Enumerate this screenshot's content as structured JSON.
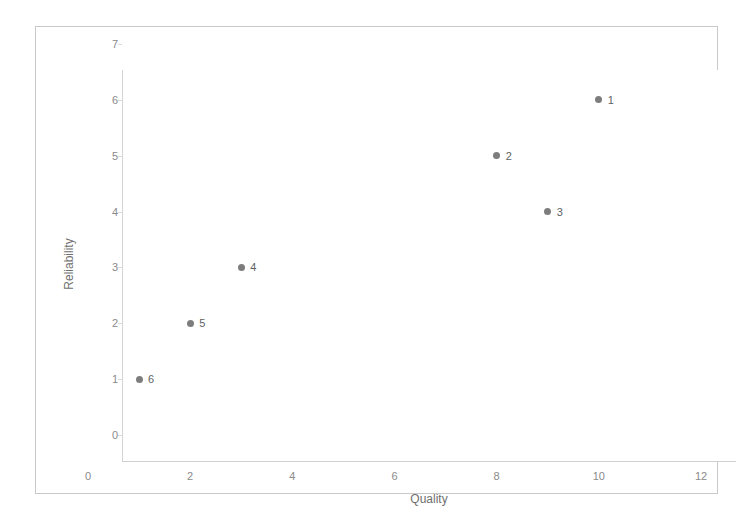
{
  "chart_data": {
    "type": "scatter",
    "title": "",
    "xlabel": "Quality",
    "ylabel": "Reliability",
    "xlim": [
      0,
      12
    ],
    "ylim": [
      0,
      7
    ],
    "xticks": [
      "0",
      "2",
      "4",
      "6",
      "8",
      "10",
      "12"
    ],
    "yticks": [
      "0",
      "1",
      "2",
      "3",
      "4",
      "5",
      "6",
      "7"
    ],
    "grid": false,
    "legend": "none",
    "marker_color": "#7d7d7d",
    "label_color": "#5f5f5f",
    "axis_color": "#d0d0d0",
    "tick_text_color": "#8a8a8a",
    "border_color": "#c9c9c9",
    "background": "#ffffff",
    "points": [
      {
        "label": "1",
        "x": 10,
        "y": 6
      },
      {
        "label": "2",
        "x": 8,
        "y": 5
      },
      {
        "label": "3",
        "x": 9,
        "y": 4
      },
      {
        "label": "4",
        "x": 3,
        "y": 3
      },
      {
        "label": "5",
        "x": 2,
        "y": 2
      },
      {
        "label": "6",
        "x": 1,
        "y": 1
      }
    ]
  }
}
